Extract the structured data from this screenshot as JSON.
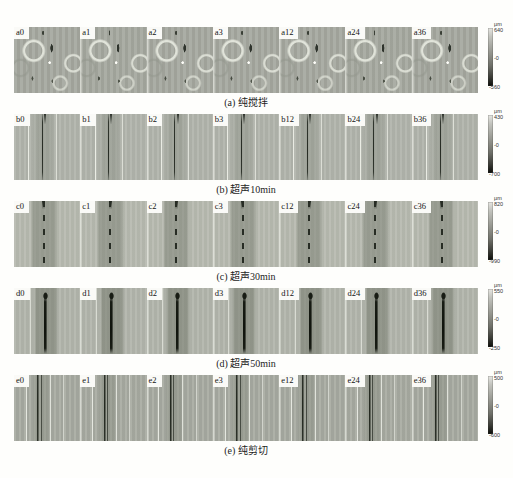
{
  "figure": {
    "background_color": "#fefefc",
    "rows": [
      {
        "id": "a",
        "caption": "(a) 纯搅拌",
        "panels": [
          "a0",
          "a1",
          "a2",
          "a3",
          "a12",
          "a24",
          "a36"
        ],
        "colorbar": {
          "unit": "μm",
          "max": "640",
          "mid": "-0",
          "min": "-560"
        }
      },
      {
        "id": "b",
        "caption": "(b) 超声10min",
        "panels": [
          "b0",
          "b1",
          "b2",
          "b3",
          "b12",
          "b24",
          "b36"
        ],
        "colorbar": {
          "unit": "μm",
          "max": "430",
          "mid": "-0",
          "min": "-700"
        }
      },
      {
        "id": "c",
        "caption": "(c) 超声30min",
        "panels": [
          "c0",
          "c1",
          "c2",
          "c3",
          "c12",
          "c24",
          "c36"
        ],
        "colorbar": {
          "unit": "μm",
          "max": "820",
          "mid": "-0",
          "min": "-990"
        }
      },
      {
        "id": "d",
        "caption": "(d) 超声50min",
        "panels": [
          "d0",
          "d1",
          "d2",
          "d3",
          "d12",
          "d24",
          "d36"
        ],
        "colorbar": {
          "unit": "μm",
          "max": "550",
          "mid": "-0",
          "min": "-250"
        }
      },
      {
        "id": "e",
        "caption": "(e) 纯剪切",
        "panels": [
          "e0",
          "e1",
          "e2",
          "e3",
          "e12",
          "e24",
          "e36"
        ],
        "colorbar": {
          "unit": "μm",
          "max": "500",
          "mid": "-0",
          "min": "-600"
        }
      }
    ]
  }
}
